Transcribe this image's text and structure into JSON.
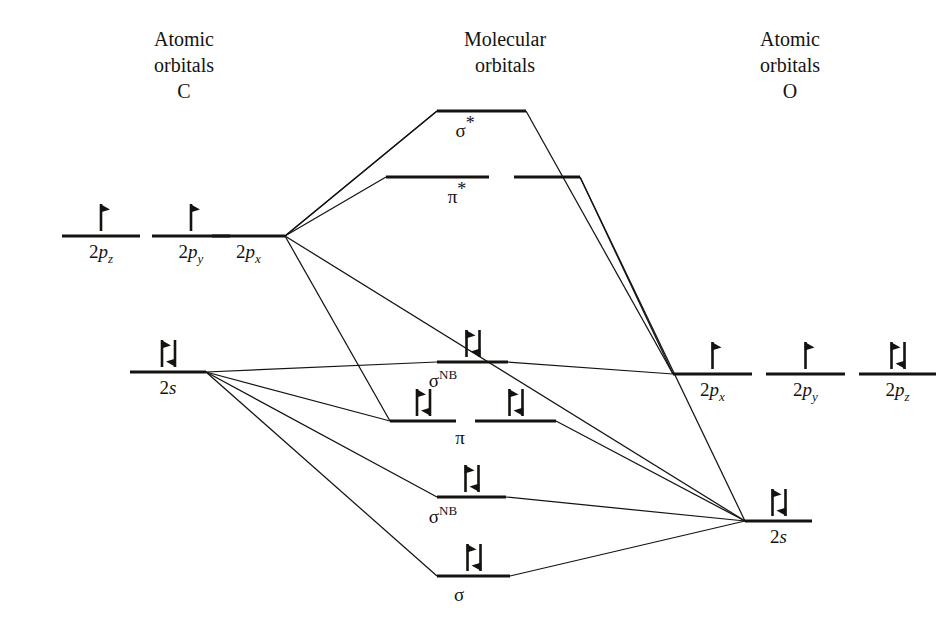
{
  "diagram": {
    "type": "molecular-orbital-correlation-diagram",
    "background_color": "#ffffff",
    "line_color": "#15130f"
  },
  "headers": {
    "left": {
      "line1": "Atomic",
      "line2": "orbitals",
      "line3": "C"
    },
    "center": {
      "line1": "Molecular",
      "line2": "orbitals",
      "line3": ""
    },
    "right": {
      "line1": "Atomic",
      "line2": "orbitals",
      "line3": "O"
    }
  },
  "left_atom": {
    "element": "C",
    "levels": [
      {
        "id": "c-2pz",
        "label_main": "2",
        "label_ital": "p",
        "label_sub": "z",
        "electrons": 1,
        "x1": 62,
        "x2": 140,
        "y": 236
      },
      {
        "id": "c-2py",
        "label_main": "2",
        "label_ital": "p",
        "label_sub": "y",
        "electrons": 1,
        "x1": 152,
        "x2": 230,
        "y": 236
      },
      {
        "id": "c-2px",
        "label_main": "2",
        "label_ital": "p",
        "label_sub": "x",
        "electrons": 0,
        "x1": 212,
        "x2": 285,
        "y": 236
      },
      {
        "id": "c-2s",
        "label_main": "2",
        "label_ital": "s",
        "label_sub": "",
        "electrons": 2,
        "x1": 130,
        "x2": 206,
        "y": 372
      }
    ]
  },
  "right_atom": {
    "element": "O",
    "levels": [
      {
        "id": "o-2px",
        "label_main": "2",
        "label_ital": "p",
        "label_sub": "x",
        "electrons": 1,
        "x1": 673,
        "x2": 752,
        "y": 374
      },
      {
        "id": "o-2py",
        "label_main": "2",
        "label_ital": "p",
        "label_sub": "y",
        "electrons": 1,
        "x1": 766,
        "x2": 845,
        "y": 374
      },
      {
        "id": "o-2pz",
        "label_main": "2",
        "label_ital": "p",
        "label_sub": "z",
        "electrons": 2,
        "x1": 859,
        "x2": 936,
        "y": 374
      },
      {
        "id": "o-2s",
        "label_main": "2",
        "label_ital": "s",
        "label_sub": "",
        "electrons": 2,
        "x1": 745,
        "x2": 812,
        "y": 521
      }
    ]
  },
  "molecular_levels": [
    {
      "id": "mo-sigma-star",
      "symbol": "σ",
      "superscript": "*",
      "name": "sigma-antibonding",
      "electrons": 0,
      "segments": [
        {
          "x1": 437,
          "x2": 526,
          "y": 111
        }
      ],
      "label_x": 465,
      "label_y": 137
    },
    {
      "id": "mo-pi-star",
      "symbol": "π",
      "superscript": "*",
      "name": "pi-antibonding",
      "electrons": 0,
      "segments": [
        {
          "x1": 386,
          "x2": 489,
          "y": 177
        },
        {
          "x1": 514,
          "x2": 580,
          "y": 177
        }
      ],
      "label_x": 457,
      "label_y": 203
    },
    {
      "id": "mo-sigma-nb-upper",
      "symbol": "σ",
      "superscript": "NB",
      "name": "sigma-nonbonding-upper",
      "electrons": 2,
      "segments": [
        {
          "x1": 437,
          "x2": 508,
          "y": 362
        }
      ],
      "label_x": 443,
      "label_y": 387
    },
    {
      "id": "mo-pi",
      "symbol": "π",
      "superscript": "",
      "name": "pi-bonding",
      "electrons": 4,
      "segments": [
        {
          "x1": 390,
          "x2": 456,
          "y": 421
        },
        {
          "x1": 475,
          "x2": 556,
          "y": 421
        }
      ],
      "label_x": 460,
      "label_y": 444
    },
    {
      "id": "mo-sigma-nb-lower",
      "symbol": "σ",
      "superscript": "NB",
      "name": "sigma-nonbonding-lower",
      "electrons": 2,
      "segments": [
        {
          "x1": 437,
          "x2": 506,
          "y": 497
        }
      ],
      "label_x": 443,
      "label_y": 523
    },
    {
      "id": "mo-sigma",
      "symbol": "σ",
      "superscript": "",
      "name": "sigma-bonding",
      "electrons": 2,
      "segments": [
        {
          "x1": 437,
          "x2": 510,
          "y": 576
        }
      ],
      "label_x": 459,
      "label_y": 601
    }
  ],
  "correlation_lines": [
    {
      "from": "c-2px",
      "to": "mo-sigma-star",
      "x1": 285,
      "y1": 236,
      "x2": 437,
      "y2": 111
    },
    {
      "from": "c-2px",
      "to": "mo-pi-star-a",
      "x1": 285,
      "y1": 236,
      "x2": 386,
      "y2": 177
    },
    {
      "from": "c-2px",
      "to": "mo-pi-star-b",
      "x1": 285,
      "y1": 236,
      "x2": 437,
      "y2": 111
    },
    {
      "from": "c-2px",
      "to": "mo-pi-a",
      "x1": 285,
      "y1": 236,
      "x2": 390,
      "y2": 421
    },
    {
      "from": "c-2px",
      "to": "o-2s",
      "x1": 285,
      "y1": 236,
      "x2": 745,
      "y2": 521
    },
    {
      "from": "c-2s",
      "to": "mo-sigma-nb-upper",
      "x1": 206,
      "y1": 372,
      "x2": 437,
      "y2": 362
    },
    {
      "from": "c-2s",
      "to": "mo-pi-a",
      "x1": 206,
      "y1": 372,
      "x2": 390,
      "y2": 421
    },
    {
      "from": "c-2s",
      "to": "mo-sigma-nb-lower",
      "x1": 206,
      "y1": 372,
      "x2": 437,
      "y2": 497
    },
    {
      "from": "c-2s",
      "to": "mo-sigma",
      "x1": 206,
      "y1": 372,
      "x2": 437,
      "y2": 576
    },
    {
      "from": "o-2px",
      "to": "mo-sigma-star",
      "x1": 673,
      "y1": 374,
      "x2": 526,
      "y2": 111
    },
    {
      "from": "o-2px",
      "to": "mo-pi-star-b",
      "x1": 673,
      "y1": 374,
      "x2": 580,
      "y2": 177
    },
    {
      "from": "o-2px",
      "to": "mo-sigma-nb-upper",
      "x1": 673,
      "y1": 374,
      "x2": 508,
      "y2": 362
    },
    {
      "from": "o-2s",
      "to": "mo-pi-star-b",
      "x1": 745,
      "y1": 521,
      "x2": 580,
      "y2": 177
    },
    {
      "from": "o-2s",
      "to": "mo-pi-b",
      "x1": 745,
      "y1": 521,
      "x2": 556,
      "y2": 421
    },
    {
      "from": "o-2s",
      "to": "mo-sigma-nb-lower",
      "x1": 745,
      "y1": 521,
      "x2": 506,
      "y2": 497
    },
    {
      "from": "o-2s",
      "to": "mo-sigma",
      "x1": 745,
      "y1": 521,
      "x2": 510,
      "y2": 576
    }
  ],
  "electron_counts": {
    "total_valence_electrons": 10,
    "carbon_valence": 4,
    "oxygen_valence": 6
  }
}
